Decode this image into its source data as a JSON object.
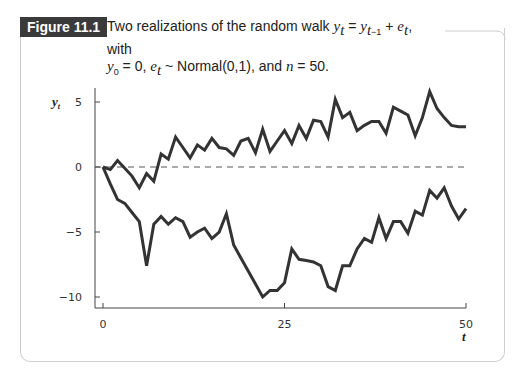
{
  "figure": {
    "label": "Figure 11.1",
    "caption_line1_prefix": "Two realizations of the random walk ",
    "caption_line1_suffix": ", with",
    "caption_line2": ", e_t ~ Normal(0,1), and n = 50."
  },
  "colors": {
    "line": "#333333",
    "label_bg": "#3a3a3a",
    "frame": "#cfcfcf",
    "zero_line": "#555555"
  },
  "chart_data": {
    "type": "line",
    "xlabel": "t",
    "ylabel": "y_t",
    "xlim": [
      0,
      50
    ],
    "ylim": [
      -10.5,
      6
    ],
    "x_ticks": [
      0,
      25,
      50
    ],
    "y_ticks": [
      -10,
      -5,
      0,
      5
    ],
    "grid": false,
    "reference_line": {
      "y": 0,
      "style": "dashed"
    },
    "series": [
      {
        "name": "realization 1 (upper)",
        "x": [
          0,
          1,
          2,
          3,
          4,
          5,
          6,
          7,
          8,
          9,
          10,
          11,
          12,
          13,
          14,
          15,
          16,
          17,
          18,
          19,
          20,
          21,
          22,
          23,
          24,
          25,
          26,
          27,
          28,
          29,
          30,
          31,
          32,
          33,
          34,
          35,
          36,
          37,
          38,
          39,
          40,
          41,
          42,
          43,
          44,
          45,
          46,
          47,
          48,
          49,
          50
        ],
        "values": [
          0,
          -0.2,
          0.5,
          -0.1,
          -0.7,
          -1.6,
          -0.5,
          -1.1,
          1.0,
          0.6,
          2.3,
          1.5,
          0.7,
          1.7,
          1.3,
          2.2,
          1.5,
          1.4,
          0.9,
          2.0,
          2.2,
          1.1,
          2.9,
          1.2,
          2.0,
          2.8,
          1.8,
          3.2,
          2.2,
          3.6,
          3.5,
          2.3,
          5.2,
          3.8,
          4.2,
          2.8,
          3.2,
          3.5,
          3.5,
          2.6,
          4.6,
          4.3,
          4.0,
          2.4,
          3.8,
          5.8,
          4.5,
          3.8,
          3.2,
          3.1,
          3.1
        ]
      },
      {
        "name": "realization 2 (lower)",
        "x": [
          0,
          1,
          2,
          3,
          4,
          5,
          6,
          7,
          8,
          9,
          10,
          11,
          12,
          13,
          14,
          15,
          16,
          17,
          18,
          19,
          20,
          21,
          22,
          23,
          24,
          25,
          26,
          27,
          28,
          29,
          30,
          31,
          32,
          33,
          34,
          35,
          36,
          37,
          38,
          39,
          40,
          41,
          42,
          43,
          44,
          45,
          46,
          47,
          48,
          49,
          50
        ],
        "values": [
          0,
          -1.3,
          -2.5,
          -2.8,
          -3.5,
          -4.2,
          -7.6,
          -4.4,
          -3.8,
          -4.4,
          -3.9,
          -4.2,
          -5.4,
          -5.0,
          -4.7,
          -5.5,
          -5.0,
          -3.6,
          -6.0,
          -7.0,
          -8.0,
          -9.0,
          -10.0,
          -9.5,
          -9.5,
          -8.9,
          -6.3,
          -7.1,
          -7.2,
          -7.3,
          -7.6,
          -9.2,
          -9.5,
          -7.6,
          -7.6,
          -6.3,
          -5.5,
          -5.8,
          -3.9,
          -5.5,
          -4.2,
          -4.2,
          -5.1,
          -3.4,
          -3.7,
          -1.8,
          -2.4,
          -1.6,
          -3.0,
          -4.0,
          -3.2
        ]
      }
    ]
  }
}
